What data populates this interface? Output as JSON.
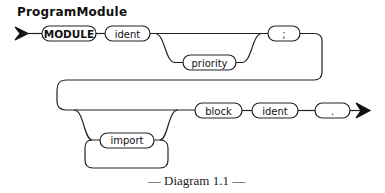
{
  "title": "ProgramModule",
  "nodes": {
    "module": "MODULE",
    "ident1": "ident",
    "priority": "priority",
    "semicolon": ";",
    "import": "import",
    "block": "block",
    "ident2": "ident",
    "period": "."
  },
  "caption": "— Diagram 1.1 —",
  "colors": {
    "stroke": "#222222",
    "background": "#ffffff"
  }
}
